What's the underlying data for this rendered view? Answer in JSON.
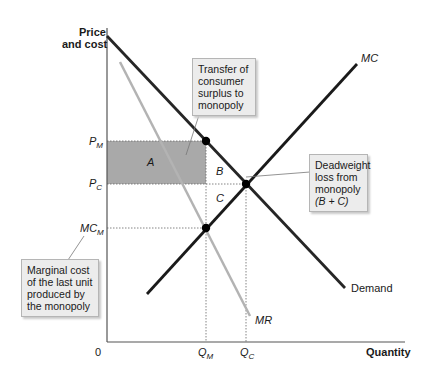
{
  "axes": {
    "y_label_line1": "Price",
    "y_label_line2": "and cost",
    "x_label": "Quantity",
    "origin": "0"
  },
  "y_ticks": {
    "pm": {
      "main": "P",
      "sub": "M"
    },
    "pc": {
      "main": "P",
      "sub": "C"
    },
    "mcm": {
      "main": "MC",
      "sub": "M"
    }
  },
  "x_ticks": {
    "qm": {
      "main": "Q",
      "sub": "M"
    },
    "qc": {
      "main": "Q",
      "sub": "C"
    }
  },
  "curves": {
    "demand": "Demand",
    "mc": "MC",
    "mr": "MR"
  },
  "regions": {
    "a": "A",
    "b": "B",
    "c": "C"
  },
  "callouts": {
    "transfer": [
      "Transfer of",
      "consumer",
      "surplus to",
      "monopoly"
    ],
    "deadweight": [
      "Deadweight",
      "loss from",
      "monopoly",
      "(B + C)"
    ],
    "marginal": [
      "Marginal cost",
      "of the last unit",
      "produced by",
      "the monopoly"
    ]
  },
  "colors": {
    "demand": "#262626",
    "mc": "#1a1a1a",
    "mr": "#b3b3b3",
    "shaded": "#a9a9a9",
    "callout_bg": "#ececec"
  }
}
